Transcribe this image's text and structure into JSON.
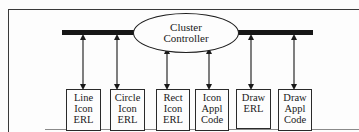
{
  "diagram": {
    "type": "architecture",
    "controller": {
      "lines": [
        "Cluster",
        "Controller"
      ]
    },
    "bus": {
      "label": ""
    },
    "modules": [
      {
        "id": "line-icon-erl",
        "lines": [
          "Line",
          "Icon",
          "ERL"
        ],
        "connects_to": "bus"
      },
      {
        "id": "circle-icon-erl",
        "lines": [
          "Circle",
          "Icon",
          "ERL"
        ],
        "connects_to": "bus"
      },
      {
        "id": "rect-icon-erl",
        "lines": [
          "Rect",
          "Icon",
          "ERL"
        ],
        "connects_to": "controller"
      },
      {
        "id": "icon-appl-code",
        "lines": [
          "Icon",
          "Appl",
          "Code"
        ],
        "connects_to": "controller"
      },
      {
        "id": "draw-erl",
        "lines": [
          "Draw",
          "ERL"
        ],
        "connects_to": "bus"
      },
      {
        "id": "draw-appl-code",
        "lines": [
          "Draw",
          "Appl",
          "Code"
        ],
        "connects_to": "bus"
      }
    ],
    "edges": [
      {
        "from": "bus",
        "to": "line-icon-erl",
        "bidirectional": true
      },
      {
        "from": "bus",
        "to": "circle-icon-erl",
        "bidirectional": true
      },
      {
        "from": "controller",
        "to": "rect-icon-erl",
        "bidirectional": true
      },
      {
        "from": "controller",
        "to": "icon-appl-code",
        "bidirectional": true
      },
      {
        "from": "bus",
        "to": "draw-erl",
        "bidirectional": true
      },
      {
        "from": "bus",
        "to": "draw-appl-code",
        "bidirectional": true
      }
    ],
    "colors": {
      "ink": "#1a1a1a",
      "background": "#fdfdfd"
    }
  }
}
